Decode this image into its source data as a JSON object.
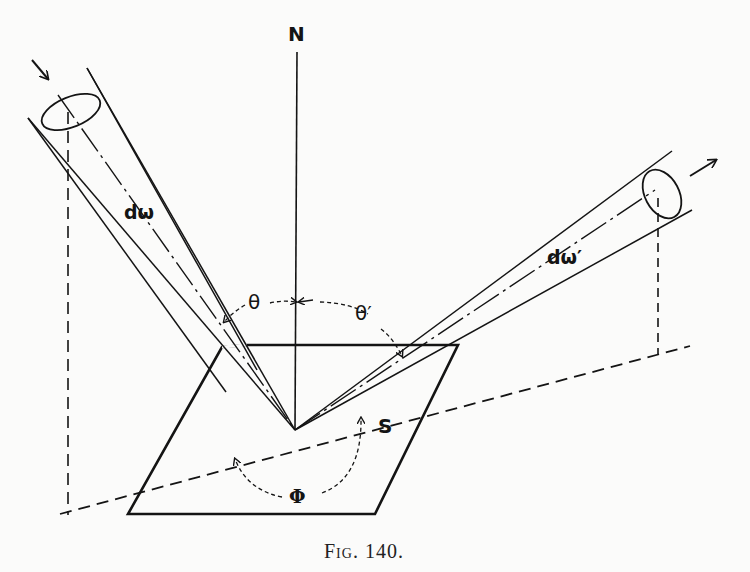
{
  "figure": {
    "caption": "Fig. 140.",
    "labels": {
      "normal": "N",
      "incident_solid_angle": "dω",
      "reflected_solid_angle": "dω′",
      "incident_angle": "θ",
      "reflected_angle": "θ′",
      "azimuth_angle": "Φ",
      "surface": "S"
    },
    "colors": {
      "ink": "#141414",
      "paper": "#fbfbfa"
    }
  }
}
